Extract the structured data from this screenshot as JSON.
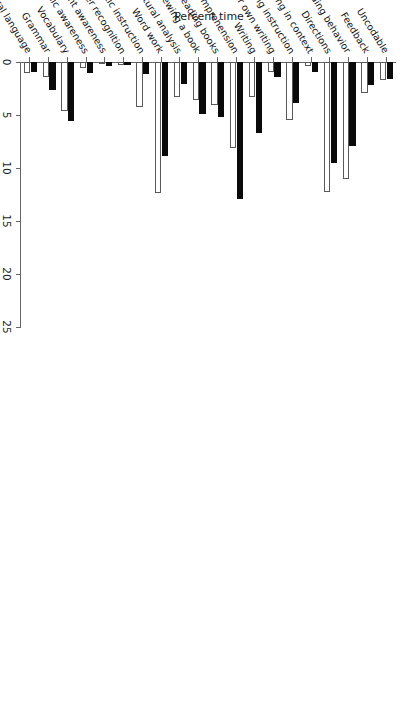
{
  "chart_data": {
    "type": "bar",
    "orientation": "horizontal",
    "title": "",
    "xlabel": "Percent time",
    "ylabel": "",
    "xlim": [
      0,
      25
    ],
    "xticks": [
      0,
      5,
      10,
      15,
      20,
      25
    ],
    "grid": false,
    "legend": null,
    "categories": [
      "Oral language",
      "Grammar",
      "Vocabulary",
      "Phonemic awareness",
      "Book and print awareness",
      "Letter recognition",
      "Alphabetic instruction",
      "Word work",
      "Structural analysis",
      "Previewing a book",
      "Reading books",
      "Reading comprehension",
      "Writing",
      "Reading their own writing",
      "Spelling instruction",
      "Spelling in context",
      "Directions",
      "Nonreading behavior",
      "Feedback",
      "Uncodable"
    ],
    "series": [
      {
        "name": "series-dark",
        "color": "#0a0a0a",
        "values": [
          0.9,
          2.6,
          5.6,
          1.0,
          0.4,
          0.3,
          1.1,
          8.9,
          2.1,
          4.9,
          5.2,
          12.9,
          6.7,
          1.4,
          3.9,
          0.9,
          9.5,
          7.9,
          2.2,
          1.6
        ]
      },
      {
        "name": "series-light",
        "color": "#ffffff",
        "values": [
          1.0,
          1.4,
          4.6,
          0.6,
          0.2,
          0.3,
          4.2,
          12.4,
          3.3,
          3.6,
          4.1,
          8.1,
          3.3,
          0.9,
          5.5,
          0.4,
          12.3,
          11.0,
          2.9,
          1.7
        ]
      }
    ]
  },
  "axis": {
    "value_axis_label": "Percent time",
    "tick_labels": [
      "0",
      "5",
      "10",
      "15",
      "20",
      "25"
    ]
  }
}
